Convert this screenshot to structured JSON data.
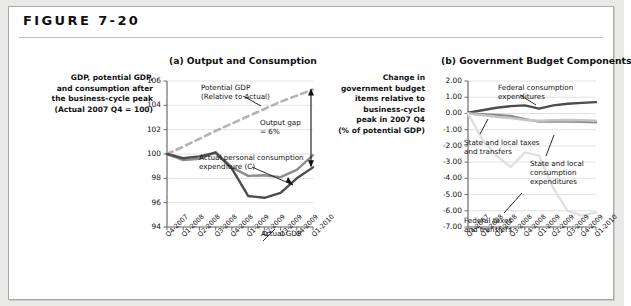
{
  "figure": {
    "label": "FIGURE 7-20"
  },
  "panel_a": {
    "title": "(a) Output and Consumption",
    "caption": "GDP, potential GDP,\nand consumption after\nthe business-cycle peak\n(Actual 2007 Q4 = 100)",
    "annotations": {
      "potential": "Potential GDP\n(Relative to Actual)",
      "gap": "Output gap\n= 6%",
      "consumption": "Actual personal consumption\nexpenditure (C)",
      "gdp": "Actual GDP"
    }
  },
  "panel_b": {
    "title": "(b) Government Budget Components",
    "caption": "Change in\ngovernment budget\nitems relative to\nbusiness-cycle\npeak in 2007 Q4\n(% of potential GDP)",
    "annotations": {
      "federal_consumption": "Federal consumption\nexpenditures",
      "state_local_taxes": "State and local taxes\nand transfers",
      "state_local_consumption": "State and local\nconsumption\nexpenditures",
      "federal_taxes": "Federal taxes\nand transfers"
    }
  },
  "colors": {
    "dark_line": "#4d4d4d",
    "mid_line": "#8c8c8c",
    "light_line": "#d2d2d2",
    "dashed_line": "#b3b3b3",
    "axis": "#6b6b6b",
    "grid": "#e2e2e2",
    "text": "#111111",
    "card_bg": "#ffffff",
    "page_bg": "#e9e9e7"
  },
  "chart_data": [
    {
      "id": "panel_a",
      "type": "line",
      "title": "(a) Output and Consumption",
      "xlabel": "",
      "ylabel": "GDP, potential GDP, and consumption after the business-cycle peak (Actual 2007 Q4 = 100)",
      "categories": [
        "Q4-2007",
        "Q1-2008",
        "Q2-2008",
        "Q3-2008",
        "Q4-2008",
        "Q1-2009",
        "Q2-2009",
        "Q3-2009",
        "Q4-2009",
        "Q1-2010"
      ],
      "yticks": [
        94,
        96,
        98,
        100,
        102,
        104,
        106
      ],
      "ylim": [
        94,
        106
      ],
      "grid": true,
      "legend": "annotations-in-plot",
      "series": [
        {
          "name": "Potential GDP (Relative to Actual)",
          "style": "dashed",
          "color": "#b3b3b3",
          "values": [
            100.0,
            100.6,
            101.25,
            101.9,
            102.5,
            103.1,
            103.7,
            104.3,
            104.8,
            105.3
          ]
        },
        {
          "name": "Actual personal consumption expenditure (C)",
          "style": "solid",
          "color": "#8c8c8c",
          "values": [
            100.0,
            99.5,
            99.6,
            100.15,
            98.9,
            98.2,
            98.25,
            98.1,
            98.7,
            99.9
          ]
        },
        {
          "name": "Actual GDP",
          "style": "solid",
          "color": "#4d4d4d",
          "values": [
            100.0,
            99.65,
            99.8,
            100.1,
            98.8,
            96.55,
            96.4,
            96.8,
            98.0,
            98.9
          ]
        }
      ],
      "annotations": [
        {
          "text": "Potential GDP (Relative to Actual)",
          "target_series": "Potential GDP (Relative to Actual)"
        },
        {
          "text": "Output gap = 6%",
          "type": "double-arrow",
          "from_value": 105.3,
          "to_value": 99.0
        },
        {
          "text": "Actual personal consumption expenditure (C)",
          "target_series": "Actual personal consumption expenditure (C)"
        },
        {
          "text": "Actual GDP",
          "target_series": "Actual GDP"
        }
      ]
    },
    {
      "id": "panel_b",
      "type": "line",
      "title": "(b) Government Budget Components",
      "xlabel": "",
      "ylabel": "Change in government budget items relative to business-cycle peak in 2007 Q4 (% of potential GDP)",
      "categories": [
        "Q4-2007",
        "Q1-2008",
        "Q2-2008",
        "Q3-2008",
        "Q4-2008",
        "Q1-2009",
        "Q2-2009",
        "Q3-2009",
        "Q4-2009",
        "Q1-2010"
      ],
      "yticks": [
        -7.0,
        -6.0,
        -5.0,
        -4.0,
        -3.0,
        -2.0,
        -1.0,
        0.0,
        1.0,
        2.0
      ],
      "ylim": [
        -7.0,
        2.0
      ],
      "grid": true,
      "legend": "annotations-in-plot",
      "series": [
        {
          "name": "Federal consumption expenditures",
          "style": "solid",
          "color": "#4d4d4d",
          "values": [
            0.05,
            0.2,
            0.35,
            0.45,
            0.5,
            0.3,
            0.5,
            0.6,
            0.65,
            0.7
          ]
        },
        {
          "name": "State and local taxes and transfers",
          "style": "solid",
          "color": "#8c8c8c",
          "values": [
            0.0,
            -0.05,
            -0.1,
            -0.15,
            -0.35,
            -0.5,
            -0.5,
            -0.5,
            -0.52,
            -0.55
          ]
        },
        {
          "name": "State and local consumption expenditures",
          "style": "solid",
          "color": "#c4c4c4",
          "values": [
            0.0,
            -0.1,
            -0.2,
            -0.28,
            -0.4,
            -0.45,
            -0.42,
            -0.4,
            -0.42,
            -0.45
          ]
        },
        {
          "name": "Federal taxes and transfers",
          "style": "solid",
          "color": "#e0e0e0",
          "values": [
            0.0,
            -1.6,
            -2.6,
            -3.3,
            -2.4,
            -2.6,
            -4.6,
            -6.0,
            -6.3,
            -6.1
          ]
        }
      ],
      "annotations": [
        {
          "text": "Federal consumption expenditures",
          "target_series": "Federal consumption expenditures"
        },
        {
          "text": "State and local taxes and transfers",
          "target_series": "State and local taxes and transfers"
        },
        {
          "text": "State and local consumption expenditures",
          "target_series": "State and local consumption expenditures"
        },
        {
          "text": "Federal taxes and transfers",
          "target_series": "Federal taxes and transfers"
        }
      ]
    }
  ]
}
